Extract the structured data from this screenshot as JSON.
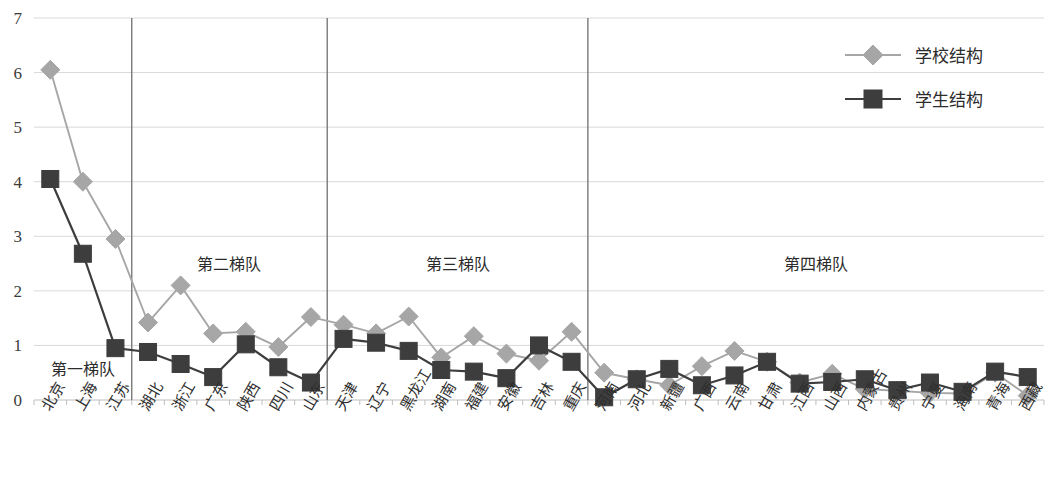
{
  "chart_data": {
    "type": "line",
    "title": "",
    "subtitle": "",
    "xlabel": "",
    "ylabel": "",
    "ylim": [
      0,
      7
    ],
    "ytick_values": [
      0,
      1,
      2,
      3,
      4,
      5,
      6,
      7
    ],
    "ytick_labels": [
      "0",
      "1",
      "2",
      "3",
      "4",
      "5",
      "6",
      "7"
    ],
    "grid": true,
    "legend_position": "top-right",
    "categories": [
      "北京",
      "上海",
      "江苏",
      "湖北",
      "浙江",
      "广东",
      "陕西",
      "四川",
      "山东",
      "天津",
      "辽宁",
      "黑龙江",
      "湖南",
      "福建",
      "安徽",
      "吉林",
      "重庆",
      "河南",
      "河北",
      "新疆",
      "广西",
      "云南",
      "甘肃",
      "江西",
      "山西",
      "内蒙古",
      "贵州",
      "宁夏",
      "海南",
      "青海",
      "西藏"
    ],
    "series": [
      {
        "name": "学校结构",
        "color": "#a6a6a6",
        "marker": "diamond",
        "values": [
          6.05,
          4.0,
          2.95,
          1.42,
          2.1,
          1.22,
          1.25,
          0.97,
          1.52,
          1.38,
          1.22,
          1.53,
          0.78,
          1.17,
          0.85,
          0.72,
          1.25,
          0.5,
          0.38,
          0.27,
          0.62,
          0.9,
          0.7,
          0.32,
          0.48,
          0.2,
          0.17,
          0.13,
          0.12,
          0.5,
          0.08
        ]
      },
      {
        "name": "学生结构",
        "color": "#3d3d3d",
        "marker": "square",
        "values": [
          4.05,
          2.68,
          0.95,
          0.88,
          0.66,
          0.42,
          1.02,
          0.6,
          0.32,
          1.12,
          1.05,
          0.9,
          0.55,
          0.52,
          0.4,
          1.0,
          0.7,
          0.05,
          0.38,
          0.57,
          0.27,
          0.45,
          0.7,
          0.3,
          0.33,
          0.38,
          0.18,
          0.32,
          0.15,
          0.52,
          0.42
        ]
      }
    ],
    "annotations": [
      {
        "text": "第一梯队",
        "category_start": 0,
        "category_end": 2
      },
      {
        "text": "第二梯队",
        "category_start": 3,
        "category_end": 8
      },
      {
        "text": "第三梯队",
        "category_start": 9,
        "category_end": 16
      },
      {
        "text": "第四梯队",
        "category_start": 17,
        "category_end": 30
      }
    ],
    "dividers_after_category_index": [
      2,
      8,
      16
    ]
  },
  "legend": {
    "items": [
      {
        "label": "学校结构",
        "color": "#a6a6a6",
        "marker": "diamond"
      },
      {
        "label": "学生结构",
        "color": "#3d3d3d",
        "marker": "square"
      }
    ]
  },
  "colors": {
    "school_series": "#a6a6a6",
    "student_series": "#3d3d3d",
    "grid": "#d9d9d9",
    "divider": "#7a7a7a",
    "text": "#2b2b2b",
    "background": "#ffffff"
  }
}
